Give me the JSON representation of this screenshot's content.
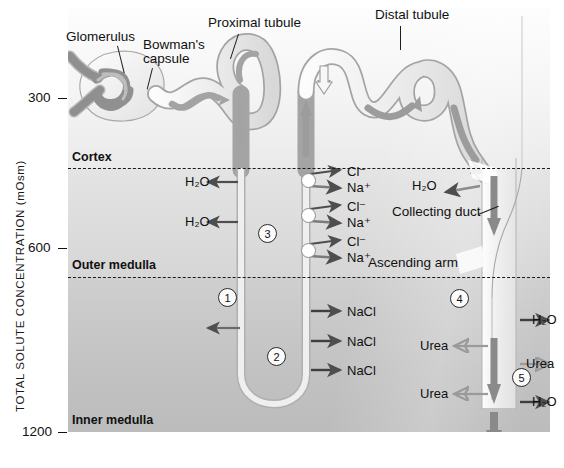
{
  "figure": {
    "type": "diagram",
    "yaxis": {
      "label": "TOTAL SOLUTE CONCENTRATION (mOsm)",
      "ticks": [
        "300",
        "600",
        "1200"
      ]
    },
    "zones": [
      {
        "name": "Cortex"
      },
      {
        "name": "Outer medulla"
      },
      {
        "name": "Inner medulla"
      }
    ],
    "structures": [
      {
        "name": "Glomerulus"
      },
      {
        "name": "Bowman's",
        "name2": "capsule"
      },
      {
        "name": "Proximal tubule"
      },
      {
        "name": "Distal tubule"
      },
      {
        "name": "Collecting duct"
      },
      {
        "name": "Ascending arm"
      }
    ],
    "solutes": {
      "water": "H₂O",
      "chloride": "Cl⁻",
      "sodium": "Na⁺",
      "salt": "NaCl",
      "urea": "Urea"
    },
    "steps": [
      "1",
      "2",
      "3",
      "4",
      "5"
    ],
    "colors": {
      "ink": "#111111",
      "arrow_dark": "#5a5a5a",
      "arrow_light": "#9a9a9a",
      "tubule_fill": "#f1f1f1",
      "tubule_stroke": "#9b9b9b",
      "flow_arrow": "#9e9e9e",
      "cortex_bg": "#f4f4f4",
      "outer_medulla_bg": "#dcdcdc",
      "inner_medulla_bg": "#c6c6c6"
    }
  }
}
